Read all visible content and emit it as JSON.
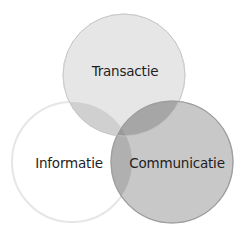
{
  "diagram": {
    "type": "venn",
    "sets": [
      {
        "id": "transactie",
        "label": "Transactie",
        "cx": 124,
        "cy": 75,
        "r": 61,
        "fill": "#e6e6e6",
        "stroke": "#d8d8d8"
      },
      {
        "id": "informatie",
        "label": "Informatie",
        "cx": 72,
        "cy": 162,
        "r": 60,
        "fill": "#ffffff",
        "stroke": "#e6e6e6"
      },
      {
        "id": "communicatie",
        "label": "Communicatie",
        "cx": 172,
        "cy": 162,
        "r": 61,
        "fill": "#c8c8c8",
        "stroke": "#a9a9a9"
      }
    ],
    "overlap_colors": {
      "transactie_informatie": "#d0d0d0",
      "transactie_communicatie": "#a6a6a6",
      "informatie_communicatie": "#b0b0b0",
      "all_three": "#9a9a9a"
    },
    "text_color": "#1e1e1e",
    "background": "#ffffff"
  }
}
